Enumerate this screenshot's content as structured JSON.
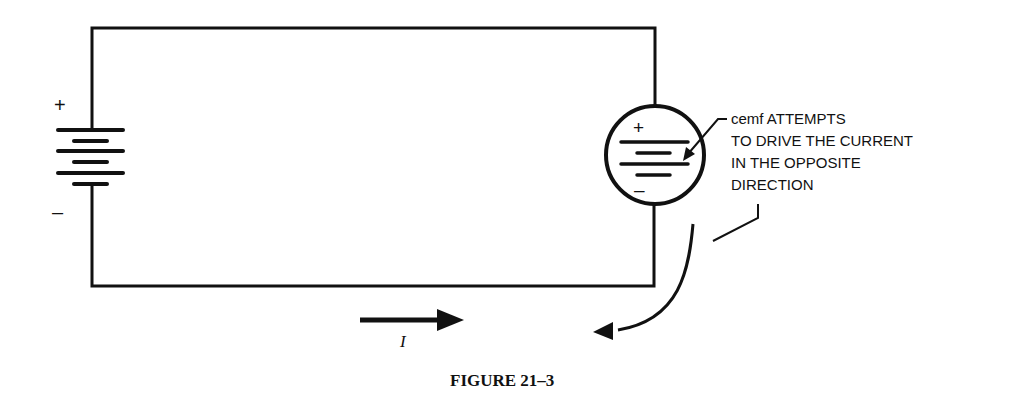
{
  "figure": {
    "caption": "FIGURE 21–3",
    "battery": {
      "plus_label": "+",
      "minus_label": "–"
    },
    "cemf_source": {
      "plus_label": "+",
      "minus_label": "–"
    },
    "annotation": {
      "lines": [
        "cemf ATTEMPTS",
        "TO DRIVE THE CURRENT",
        "IN THE OPPOSITE",
        "DIRECTION"
      ]
    },
    "current_label": "I",
    "colors": {
      "ink": "#111111",
      "background": "#ffffff"
    }
  }
}
